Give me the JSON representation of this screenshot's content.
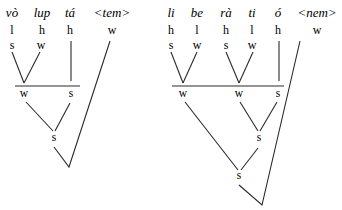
{
  "trees": [
    {
      "id": "left",
      "syllables": [
        {
          "word": "vò",
          "tone": "l",
          "stress": "s",
          "x": 12
        },
        {
          "word": "lup",
          "tone": "h",
          "stress": "w",
          "x": 42
        },
        {
          "word": "tá",
          "tone": "h",
          "stress": "",
          "x": 70
        },
        {
          "word": "<tem>",
          "tone": "w",
          "stress": "",
          "x": 112
        }
      ],
      "level2": [
        {
          "label": "w",
          "x": 24
        },
        {
          "label": "s",
          "x": 71
        }
      ],
      "level3": [
        {
          "label": "s",
          "x": 54
        }
      ]
    },
    {
      "id": "right",
      "syllables": [
        {
          "word": "li",
          "tone": "h",
          "stress": "s",
          "x": 171
        },
        {
          "word": "be",
          "tone": "l",
          "stress": "w",
          "x": 197
        },
        {
          "word": "rà",
          "tone": "h",
          "stress": "s",
          "x": 226
        },
        {
          "word": "ti",
          "tone": "l",
          "stress": "w",
          "x": 252
        },
        {
          "word": "ó",
          "tone": "h",
          "stress": "",
          "x": 278
        },
        {
          "word": "<nem>",
          "tone": "w",
          "stress": "",
          "x": 317
        }
      ],
      "level2": [
        {
          "label": "w",
          "x": 183
        },
        {
          "label": "w",
          "x": 239
        },
        {
          "label": "s",
          "x": 278
        }
      ],
      "level3": [
        {
          "label": "s",
          "x": 259
        }
      ],
      "level4": [
        {
          "label": "s",
          "x": 239
        }
      ]
    }
  ]
}
